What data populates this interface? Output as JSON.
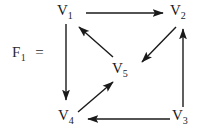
{
  "figure": {
    "name_label": "F",
    "name_subscript": "1",
    "equals": "=",
    "background_color": "#ffffff",
    "stroke_color": "#1a1a1a"
  },
  "graph": {
    "type": "directed-graph",
    "nodes": [
      {
        "id": "V1",
        "letter": "V",
        "subscript": "1",
        "x": 66,
        "y": 12
      },
      {
        "id": "V2",
        "letter": "V",
        "subscript": "2",
        "x": 179,
        "y": 12
      },
      {
        "id": "V3",
        "letter": "V",
        "subscript": "3",
        "x": 181,
        "y": 117
      },
      {
        "id": "V4",
        "letter": "V",
        "subscript": "4",
        "x": 67,
        "y": 117
      },
      {
        "id": "V5",
        "letter": "V",
        "subscript": "5",
        "x": 121,
        "y": 70
      }
    ],
    "edges": [
      {
        "from": "V1",
        "to": "V2",
        "direction": "right"
      },
      {
        "from": "V1",
        "to": "V4",
        "direction": "down"
      },
      {
        "from": "V2",
        "to": "V5",
        "direction": "down-left"
      },
      {
        "from": "V5",
        "to": "V1",
        "direction": "up-left"
      },
      {
        "from": "V4",
        "to": "V5",
        "direction": "up-right"
      },
      {
        "from": "V3",
        "to": "V2",
        "direction": "up"
      },
      {
        "from": "V3",
        "to": "V4",
        "direction": "left"
      }
    ]
  }
}
